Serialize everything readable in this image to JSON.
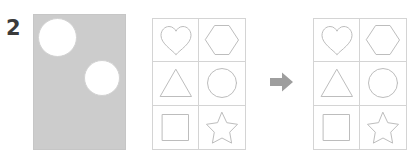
{
  "problem": {
    "number": "2",
    "type": "shape-transformation-puzzle"
  },
  "stimulus": {
    "name": "punched-card",
    "shape": "rectangle",
    "fill_color": "#cccccc",
    "holes": [
      {
        "shape": "circle",
        "position": "top-left",
        "fill_color": "#ffffff"
      },
      {
        "shape": "circle",
        "position": "middle-right",
        "fill_color": "#ffffff"
      }
    ]
  },
  "grids": [
    {
      "name": "source-grid",
      "columns": 2,
      "rows": 3,
      "stroke_color": "#bdbdbd",
      "cells": [
        {
          "shape": "heart",
          "label": "Heart"
        },
        {
          "shape": "hexagon",
          "label": "Hexagon"
        },
        {
          "shape": "triangle",
          "label": "Triangle"
        },
        {
          "shape": "circle",
          "label": "Circle"
        },
        {
          "shape": "square",
          "label": "Square"
        },
        {
          "shape": "star",
          "label": "Star"
        }
      ]
    },
    {
      "name": "result-grid",
      "columns": 2,
      "rows": 3,
      "stroke_color": "#bdbdbd",
      "cells": [
        {
          "shape": "heart",
          "label": "Heart"
        },
        {
          "shape": "hexagon",
          "label": "Hexagon"
        },
        {
          "shape": "triangle",
          "label": "Triangle"
        },
        {
          "shape": "circle",
          "label": "Circle"
        },
        {
          "shape": "square",
          "label": "Square"
        },
        {
          "shape": "star",
          "label": "Star"
        }
      ]
    }
  ],
  "arrow": {
    "name": "right-arrow-icon",
    "direction": "right",
    "color": "#9e9e9e"
  }
}
